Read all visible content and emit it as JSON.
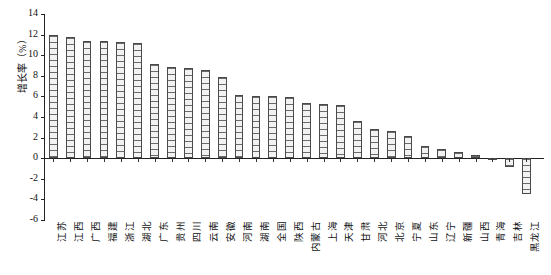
{
  "chart_data": {
    "type": "bar",
    "title": "",
    "xlabel": "",
    "ylabel": "增长率（%）",
    "ylim": [
      -6,
      14
    ],
    "yticks": [
      14,
      12,
      10,
      8,
      6,
      4,
      2,
      0,
      -2,
      -4,
      -6
    ],
    "ytick_labels": [
      "14",
      "12",
      "10",
      "8",
      "6",
      "4",
      "2",
      "0",
      "-2",
      "-4",
      "-6"
    ],
    "grid": false,
    "legend": null,
    "categories": [
      "江苏",
      "江西",
      "广西",
      "福建",
      "浙江",
      "湖北",
      "广东",
      "贵州",
      "四川",
      "云南",
      "安徽",
      "河南",
      "湖南",
      "全国",
      "陕西",
      "内蒙古",
      "上海",
      "天津",
      "甘肃",
      "河北",
      "北京",
      "宁夏",
      "山东",
      "辽宁",
      "新疆",
      "山西",
      "青海",
      "吉林",
      "黑龙江"
    ],
    "values": [
      12.0,
      11.8,
      11.4,
      11.4,
      11.3,
      11.2,
      9.1,
      8.9,
      8.8,
      8.6,
      7.9,
      6.1,
      6.0,
      6.0,
      5.9,
      5.4,
      5.3,
      5.2,
      3.6,
      2.8,
      2.6,
      2.2,
      1.2,
      0.9,
      0.6,
      0.3,
      -0.2,
      -0.9,
      -3.5
    ]
  }
}
